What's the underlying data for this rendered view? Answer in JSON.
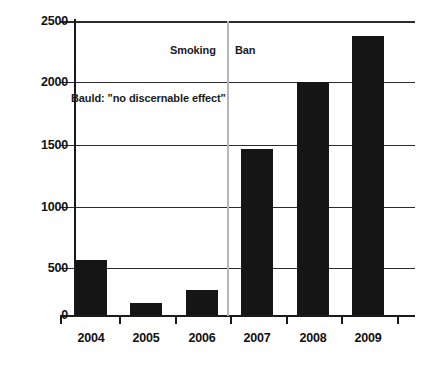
{
  "chart_data": {
    "type": "bar",
    "title": "",
    "subtitle": "",
    "xlabel": "",
    "ylabel": "",
    "categories": [
      "2004",
      "2005",
      "2006",
      "2007",
      "2008",
      "2009"
    ],
    "values": [
      470,
      100,
      215,
      1410,
      1980,
      2370
    ],
    "series": [
      {
        "name": "Count",
        "values": [
          470,
          100,
          215,
          1410,
          1980,
          2370
        ]
      }
    ],
    "ylim": [
      0,
      2500
    ],
    "yticks": [
      0,
      500,
      1000,
      1500,
      2000,
      2500
    ],
    "ytick_labels": [
      "0",
      "500",
      "1000",
      "1500",
      "2000",
      "2500"
    ],
    "grid": true,
    "legend": false,
    "legend_position": "none",
    "bar_color": "#151515",
    "gridline_color": "#2b2b2b",
    "marker_line_color": "#b7b7b7",
    "annotations": [
      {
        "id": "smoking",
        "text": "Smoking",
        "x_value": 2006.5,
        "y_value": 2290
      },
      {
        "id": "ban",
        "text": "Ban",
        "x_value": 2006.5,
        "y_value": 2290
      },
      {
        "id": "bauld",
        "text": "Bauld: \"no discernable effect\"",
        "x_value": 2004.0,
        "y_value": 1880
      }
    ],
    "vertical_marker": {
      "label": "Smoking Ban",
      "x_value": 2006.5
    }
  }
}
